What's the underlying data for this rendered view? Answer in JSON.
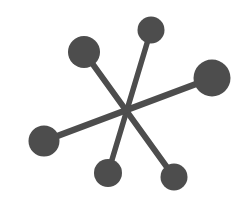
{
  "figure": {
    "name": "six-spoke-jack-shape",
    "background_color": "#ffffff",
    "ink_color": "#4d4d4d",
    "canvas": {
      "width": 250,
      "height": 210
    },
    "nodes": [
      {
        "id": "top",
        "x": 151,
        "y": 30,
        "r": 13.5
      },
      {
        "id": "upper-left",
        "x": 84,
        "y": 52,
        "r": 16
      },
      {
        "id": "right",
        "x": 212,
        "y": 78,
        "r": 18.5
      },
      {
        "id": "left",
        "x": 44,
        "y": 141,
        "r": 15.5
      },
      {
        "id": "bottom-center",
        "x": 108,
        "y": 173,
        "r": 14
      },
      {
        "id": "bottom-right",
        "x": 174,
        "y": 177,
        "r": 13.5
      }
    ],
    "edges": [
      {
        "from": "top",
        "to": "bottom-center",
        "stroke_width": 5.5
      },
      {
        "from": "upper-left",
        "to": "bottom-right",
        "stroke_width": 6
      },
      {
        "from": "right",
        "to": "left",
        "stroke_width": 6.5
      }
    ]
  }
}
